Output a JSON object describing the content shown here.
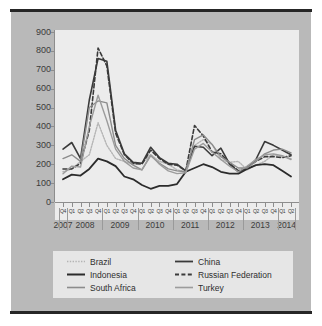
{
  "figure": {
    "background_color": "#b9b9b9",
    "plot_background_color": "#ececec",
    "legend_background_color": "#e6e6e6"
  },
  "chart_data": {
    "type": "line",
    "title": "",
    "xlabel": "",
    "ylabel": "",
    "ylim": [
      0,
      900
    ],
    "yticks": [
      0,
      100,
      200,
      300,
      400,
      500,
      600,
      700,
      800,
      900
    ],
    "grid": false,
    "legend_position": "bottom",
    "x": [
      "Q4 2007",
      "Q1 2008",
      "Q2 2008",
      "Q3 2008",
      "Q4 2008",
      "Q1 2009",
      "Q2 2009",
      "Q3 2009",
      "Q4 2009",
      "Q1 2010",
      "Q2 2010",
      "Q3 2010",
      "Q4 2010",
      "Q1 2011",
      "Q2 2011",
      "Q3 2011",
      "Q4 2011",
      "Q1 2012",
      "Q2 2012",
      "Q3 2012",
      "Q4 2012",
      "Q1 2013",
      "Q2 2013",
      "Q3 2013",
      "Q4 2013",
      "Q1 2014",
      "Q2 2014"
    ],
    "quarter_labels": [
      "Q4",
      "Q1",
      "Q2",
      "Q3",
      "Q4",
      "Q1",
      "Q2",
      "Q3",
      "Q4",
      "Q1",
      "Q2",
      "Q3",
      "Q4",
      "Q1",
      "Q2",
      "Q3",
      "Q4",
      "Q1",
      "Q2",
      "Q3",
      "Q4",
      "Q1",
      "Q2",
      "Q3",
      "Q4",
      "Q1",
      "Q2"
    ],
    "year_labels": [
      "2007",
      "2008",
      "2009",
      "2010",
      "2011",
      "2012",
      "2013",
      "2014"
    ],
    "series": [
      {
        "name": "Brazil",
        "color": "#b4b4b4",
        "style": "dotted",
        "width": 1.4,
        "values": [
          160,
          175,
          215,
          250,
          420,
          300,
          230,
          215,
          200,
          205,
          250,
          215,
          200,
          170,
          160,
          300,
          330,
          305,
          225,
          210,
          215,
          170,
          195,
          215,
          250,
          240,
          230
        ]
      },
      {
        "name": "China",
        "color": "#3a3a3a",
        "style": "solid",
        "width": 1.6,
        "values": [
          280,
          315,
          230,
          540,
          760,
          745,
          380,
          255,
          210,
          205,
          290,
          235,
          205,
          200,
          165,
          295,
          290,
          245,
          285,
          200,
          160,
          180,
          225,
          320,
          300,
          275,
          250
        ]
      },
      {
        "name": "Indonesia",
        "color": "#2b2b2b",
        "style": "solid",
        "width": 1.8,
        "values": [
          120,
          145,
          140,
          175,
          230,
          215,
          190,
          135,
          120,
          90,
          70,
          85,
          85,
          95,
          160,
          180,
          200,
          185,
          160,
          150,
          150,
          175,
          195,
          200,
          195,
          165,
          135
        ]
      },
      {
        "name": "Russian Federation",
        "color": "#3a3a3a",
        "style": "dashed",
        "width": 1.6,
        "values": [
          175,
          175,
          205,
          380,
          815,
          720,
          365,
          250,
          205,
          200,
          275,
          230,
          200,
          195,
          165,
          405,
          350,
          265,
          255,
          205,
          165,
          185,
          215,
          240,
          240,
          235,
          245
        ]
      },
      {
        "name": "South Africa",
        "color": "#8c8c8c",
        "style": "solid",
        "width": 1.4,
        "values": [
          230,
          250,
          215,
          500,
          535,
          525,
          300,
          230,
          195,
          170,
          245,
          205,
          175,
          165,
          160,
          330,
          355,
          305,
          240,
          210,
          180,
          180,
          215,
          255,
          275,
          280,
          260
        ]
      },
      {
        "name": "Turkey",
        "color": "#9c9c9c",
        "style": "solid",
        "width": 1.4,
        "values": [
          150,
          190,
          185,
          400,
          565,
          430,
          280,
          215,
          180,
          170,
          250,
          200,
          165,
          150,
          155,
          280,
          310,
          265,
          225,
          190,
          160,
          190,
          225,
          250,
          255,
          245,
          225
        ]
      }
    ]
  },
  "legend": {
    "items": [
      {
        "label": "Brazil",
        "swatch": "dotted-light-gray-line"
      },
      {
        "label": "Indonesia",
        "swatch": "solid-dark-line"
      },
      {
        "label": "South Africa",
        "swatch": "solid-gray-line"
      },
      {
        "label": "China",
        "swatch": "solid-dark-line"
      },
      {
        "label": "Russian Federation",
        "swatch": "dashed-dark-line"
      },
      {
        "label": "Turkey",
        "swatch": "solid-gray-line"
      }
    ],
    "left_column": [
      "Brazil",
      "Indonesia",
      "South Africa"
    ],
    "right_column": [
      "China",
      "Russian Federation",
      "Turkey"
    ]
  }
}
